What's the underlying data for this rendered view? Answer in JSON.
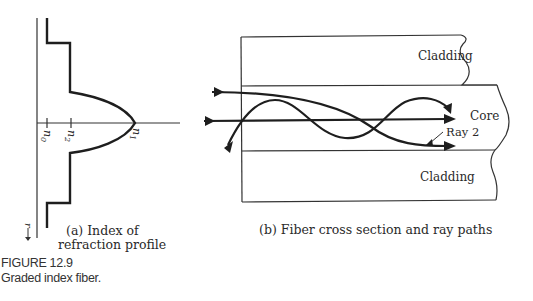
{
  "figure": {
    "number": "FIGURE 12.9",
    "title": "Graded index fiber."
  },
  "panel_a": {
    "caption_line1": "(a) Index of",
    "caption_line2": "refraction profile",
    "axis_labels": {
      "n0": "n",
      "n0_sub": "0",
      "n2": "n",
      "n2_sub": "2",
      "n1": "n",
      "n1_sub": "1",
      "r": "r"
    }
  },
  "panel_b": {
    "caption": "(b) Fiber cross section and ray paths",
    "labels": {
      "cladding_top": "Cladding",
      "core": "Core",
      "cladding_bottom": "Cladding",
      "ray2": "Ray 2"
    }
  },
  "colors": {
    "ink": "#1e1e1e",
    "background": "#ffffff"
  }
}
